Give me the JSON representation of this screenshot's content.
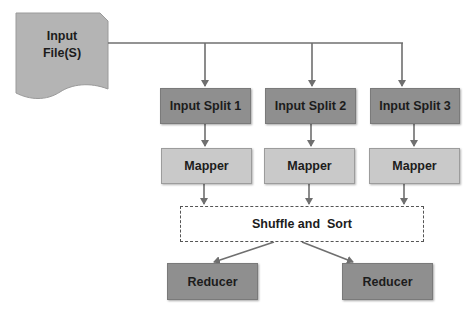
{
  "diagram": {
    "input_file": {
      "label_line1": "Input",
      "label_line2": "File(S)"
    },
    "splits": [
      {
        "label": "Input Split 1"
      },
      {
        "label": "Input Split 2"
      },
      {
        "label": "Input Split 3"
      }
    ],
    "mappers": [
      {
        "label": "Mapper"
      },
      {
        "label": "Mapper"
      },
      {
        "label": "Mapper"
      }
    ],
    "shuffle": {
      "label": "Shuffle and  Sort"
    },
    "reducers": [
      {
        "label": "Reducer"
      },
      {
        "label": "Reducer"
      }
    ],
    "colors": {
      "split_fill": "#8f8f8f",
      "mapper_fill": "#c9c9c9",
      "reducer_fill": "#8f8f8f",
      "file_fill": "#b4b4b4",
      "connector": "#6f6f6f"
    }
  }
}
